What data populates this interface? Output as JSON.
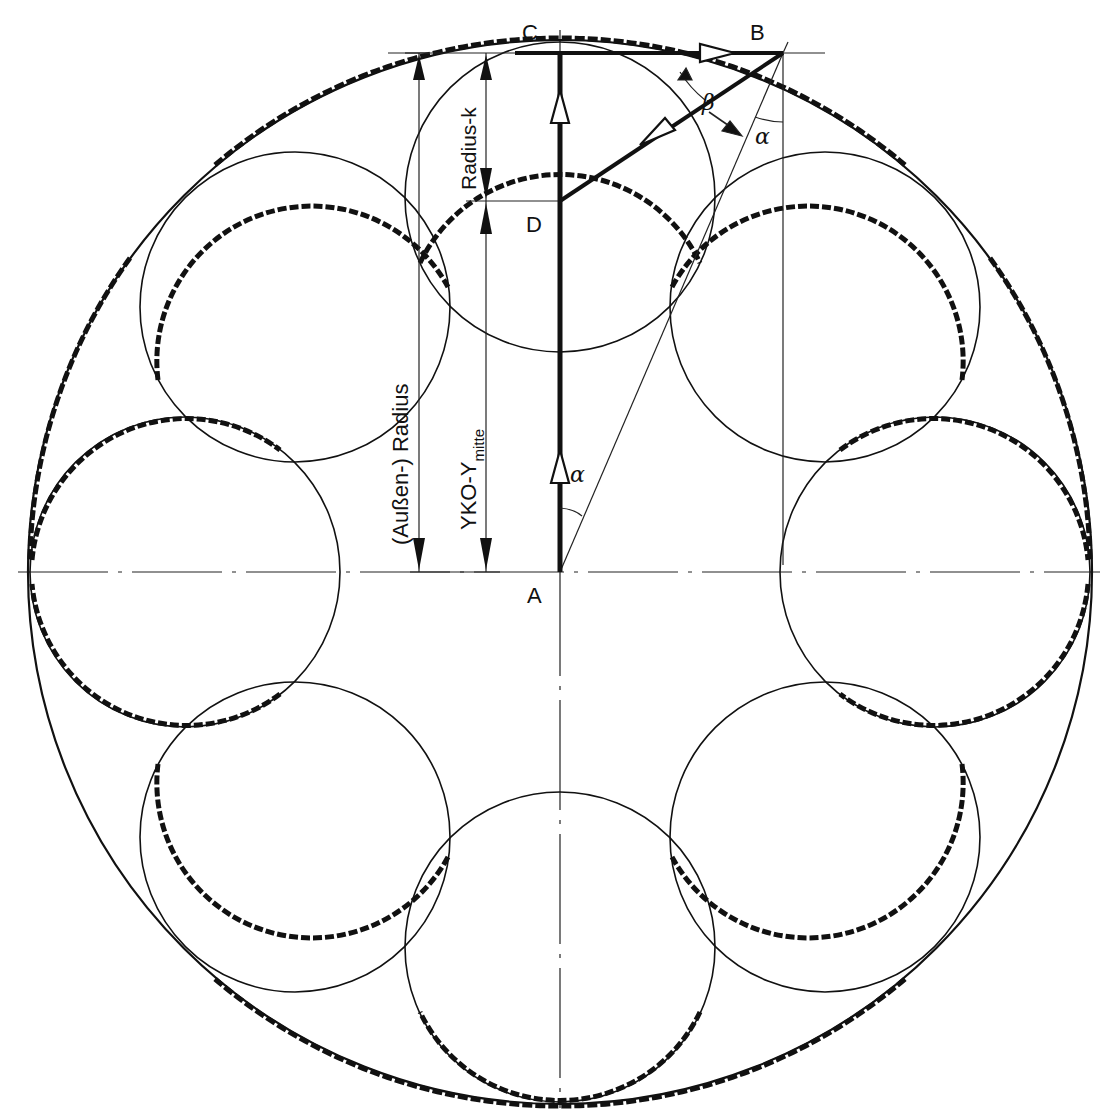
{
  "diagram": {
    "type": "geometric construction",
    "points": {
      "A": "A",
      "B": "B",
      "C": "C",
      "D": "D"
    },
    "angles": {
      "alpha": "α",
      "beta": "β"
    },
    "dimensions": {
      "outer_radius": "(Außen-) Radius",
      "ymitte_main": "YKO-Y",
      "ymitte_sub": "mitte",
      "radius_k": "Radius-k"
    },
    "geometry": {
      "center_A": [
        560,
        572
      ],
      "outer_circle_radius_px": 532,
      "lobe_count": 8,
      "lobe_center_distance_px": 375,
      "lobe_radius_px": 155,
      "line_color": "#111111",
      "background": "#ffffff"
    }
  }
}
